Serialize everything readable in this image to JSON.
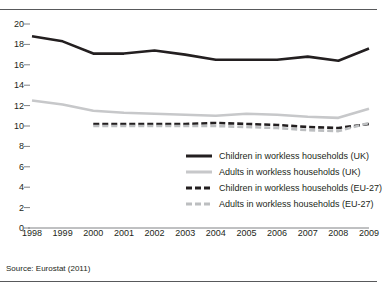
{
  "figure": {
    "clipped_title_fragment": "",
    "source_note": "Source: Eurostat (2011)"
  },
  "chart_data": {
    "type": "line",
    "title": "",
    "xlabel": "",
    "ylabel": "",
    "x": [
      1998,
      1999,
      2000,
      2001,
      2002,
      2003,
      2004,
      2005,
      2006,
      2007,
      2008,
      2009
    ],
    "categories": [
      "1998",
      "1999",
      "2000",
      "2001",
      "2002",
      "2003",
      "2004",
      "2005",
      "2006",
      "2007",
      "2008",
      "2009"
    ],
    "xlim": [
      1998,
      2009
    ],
    "ylim": [
      0,
      20
    ],
    "yticks": [
      0,
      2,
      4,
      6,
      8,
      10,
      12,
      14,
      16,
      18,
      20
    ],
    "ytick_labels": [
      "0",
      "2",
      "4",
      "6",
      "8",
      "10",
      "12",
      "14",
      "16",
      "18",
      "20"
    ],
    "grid": false,
    "legend_position": "lower-right-inside",
    "series": [
      {
        "name": "Children in workless households (UK)",
        "key": "children_uk",
        "color": "#231f20",
        "style": "solid",
        "width": 2.6,
        "values": [
          18.8,
          18.3,
          17.1,
          17.1,
          17.4,
          17.0,
          16.5,
          16.5,
          16.5,
          16.8,
          16.4,
          17.6
        ]
      },
      {
        "name": "Adults in workless households (UK)",
        "key": "adults_uk",
        "color": "#c7c8ca",
        "style": "solid",
        "width": 2.6,
        "values": [
          12.5,
          12.1,
          11.5,
          11.3,
          11.2,
          11.1,
          11.0,
          11.2,
          11.1,
          10.9,
          10.8,
          11.7
        ]
      },
      {
        "name": "Children in workless households (EU-27)",
        "key": "children_eu27",
        "color": "#231f20",
        "style": "dashed",
        "width": 2.6,
        "values": [
          null,
          null,
          10.2,
          10.2,
          10.2,
          10.2,
          10.3,
          10.2,
          10.1,
          9.9,
          9.8,
          10.2
        ]
      },
      {
        "name": "Adults in workless households (EU-27)",
        "key": "adults_eu27",
        "color": "#bcbec0",
        "style": "dashed",
        "width": 2.6,
        "values": [
          null,
          null,
          10.0,
          10.0,
          10.0,
          10.0,
          10.0,
          9.9,
          9.8,
          9.6,
          9.5,
          10.3
        ]
      }
    ],
    "legend": [
      {
        "label": "Children in workless households (UK)",
        "swatch": "sw-solid-black"
      },
      {
        "label": "Adults in workless households (UK)",
        "swatch": "sw-solid-grey"
      },
      {
        "label": "Children in workless households (EU-27)",
        "swatch": "sw-dash-black"
      },
      {
        "label": "Adults in workless households (EU-27)",
        "swatch": "sw-dash-grey"
      }
    ]
  }
}
